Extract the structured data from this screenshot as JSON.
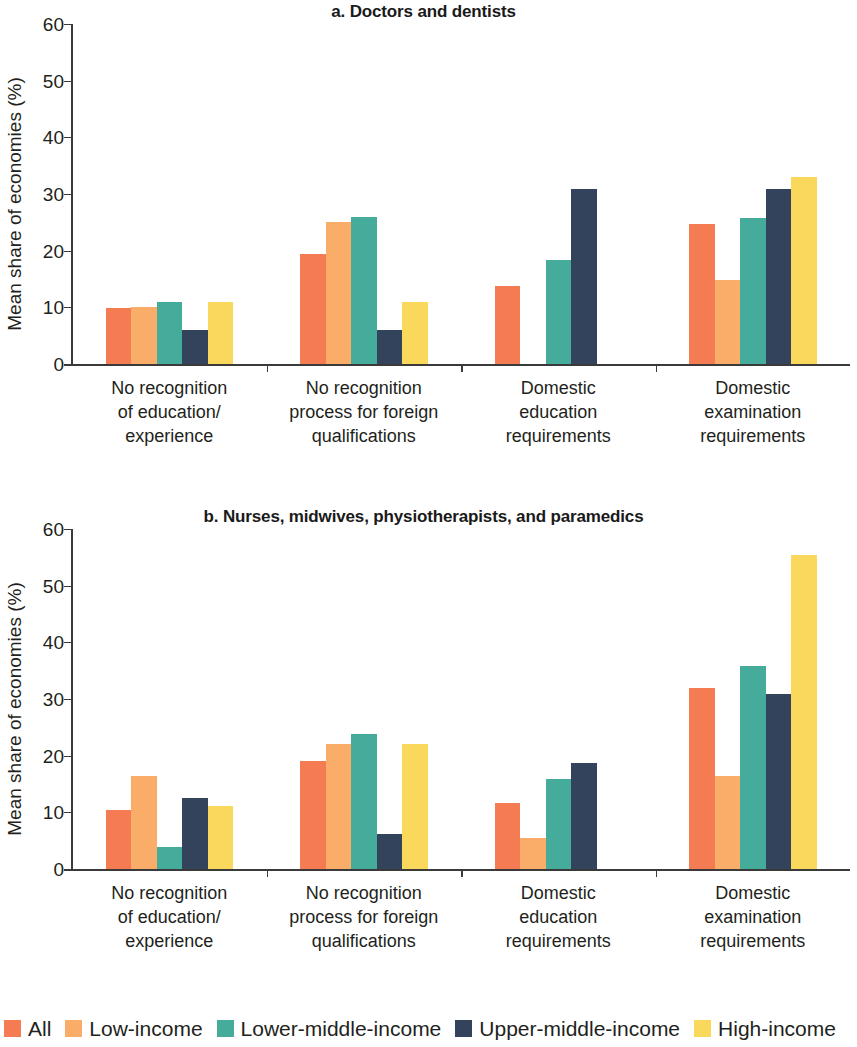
{
  "figure": {
    "ylabel": "Mean share of economies (%)",
    "ytick_labels": [
      "0",
      "10",
      "20",
      "30",
      "40",
      "50",
      "60"
    ],
    "categories": [
      "No recognition\nof education/\nexperience",
      "No recognition\nprocess for foreign\nqualifications",
      "Domestic\neducation\nrequirements",
      "Domestic\nexamination\nrequirements"
    ],
    "category_lines": [
      [
        "No recognition",
        "of education/",
        "experience"
      ],
      [
        "No recognition",
        "process for foreign",
        "qualifications"
      ],
      [
        "Domestic",
        "education",
        "requirements"
      ],
      [
        "Domestic",
        "examination",
        "requirements"
      ]
    ]
  },
  "legend": {
    "items": [
      {
        "label": "All",
        "color": "#F47B52"
      },
      {
        "label": "Low-income",
        "color": "#FAAD68"
      },
      {
        "label": "Lower-middle-income",
        "color": "#45AC9B"
      },
      {
        "label": "Upper-middle-income",
        "color": "#33435B"
      },
      {
        "label": "High-income",
        "color": "#F9D85C"
      }
    ]
  },
  "chart_data": [
    {
      "type": "bar",
      "id": "panel-a",
      "title": "a. Doctors and dentists",
      "ylabel": "Mean share of economies (%)",
      "xlabel": "",
      "ylim": [
        0,
        60
      ],
      "yticks": [
        0,
        10,
        20,
        30,
        40,
        50,
        60
      ],
      "grid": false,
      "legend_position": "bottom",
      "categories": [
        "No recognition of education/experience",
        "No recognition process for foreign qualifications",
        "Domestic education requirements",
        "Domestic examination requirements"
      ],
      "series": [
        {
          "name": "All",
          "color": "#F47B52",
          "values": [
            9.8,
            19.5,
            13.8,
            24.7
          ]
        },
        {
          "name": "Low-income",
          "color": "#FAAD68",
          "values": [
            10.0,
            25.0,
            null,
            14.9
          ]
        },
        {
          "name": "Lower-middle-income",
          "color": "#45AC9B",
          "values": [
            11.0,
            26.0,
            18.4,
            25.8
          ]
        },
        {
          "name": "Upper-middle-income",
          "color": "#33435B",
          "values": [
            6.0,
            6.0,
            30.9,
            30.9
          ]
        },
        {
          "name": "High-income",
          "color": "#F9D85C",
          "values": [
            11.0,
            10.9,
            null,
            33.0
          ]
        }
      ]
    },
    {
      "type": "bar",
      "id": "panel-b",
      "title": "b. Nurses, midwives, physiotherapists, and paramedics",
      "ylabel": "Mean share of economies (%)",
      "xlabel": "",
      "ylim": [
        0,
        60
      ],
      "yticks": [
        0,
        10,
        20,
        30,
        40,
        50,
        60
      ],
      "grid": false,
      "legend_position": "bottom",
      "categories": [
        "No recognition of education/experience",
        "No recognition process for foreign qualifications",
        "Domestic education requirements",
        "Domestic examination requirements"
      ],
      "series": [
        {
          "name": "All",
          "color": "#F47B52",
          "values": [
            10.4,
            19.0,
            11.7,
            32.0
          ]
        },
        {
          "name": "Low-income",
          "color": "#FAAD68",
          "values": [
            16.5,
            22.1,
            5.4,
            16.4
          ]
        },
        {
          "name": "Lower-middle-income",
          "color": "#45AC9B",
          "values": [
            3.9,
            23.9,
            15.8,
            35.8
          ]
        },
        {
          "name": "Upper-middle-income",
          "color": "#33435B",
          "values": [
            12.5,
            6.2,
            18.7,
            30.9
          ]
        },
        {
          "name": "High-income",
          "color": "#F9D85C",
          "values": [
            11.1,
            22.0,
            null,
            55.4
          ]
        }
      ]
    }
  ]
}
